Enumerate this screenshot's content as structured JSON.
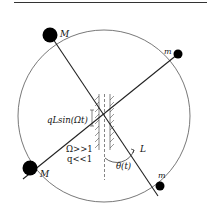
{
  "diagram": {
    "labels": {
      "mass_big_top": "M",
      "mass_big_bottom": "M",
      "mass_small_top": "m",
      "mass_small_bottom": "m",
      "pivot_oscillation": "qLsin(Ωt)",
      "omega_condition": "Ω>>1",
      "q_condition": "q<<1",
      "length": "L",
      "angle": "θ(t)"
    },
    "colors": {
      "stroke": "#222222",
      "mass": "#000000",
      "circle": "#555555"
    }
  }
}
